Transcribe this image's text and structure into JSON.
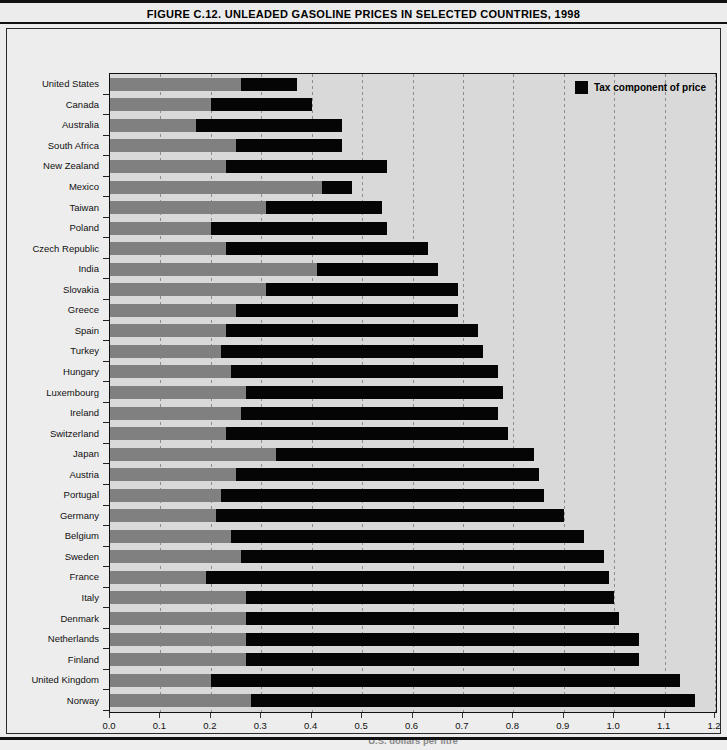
{
  "figure": {
    "title": "FIGURE C.12. UNLEADED GASOLINE PRICES IN SELECTED COUNTRIES, 1998"
  },
  "legend": {
    "label": "Tax component of price",
    "swatch_color": "#050505"
  },
  "colors": {
    "base_price": "#808080",
    "tax": "#050505",
    "plot_background": "#d9d9d9",
    "page_background": "#ececec",
    "axis_title": "#8a8a8a"
  },
  "chart_data": {
    "type": "bar",
    "orientation": "horizontal",
    "stacked": true,
    "title": "FIGURE C.12. UNLEADED GASOLINE PRICES IN SELECTED COUNTRIES, 1998",
    "xlabel": "U.S. dollars per litre",
    "ylabel": "",
    "xlim": [
      0.0,
      1.2
    ],
    "xticks": [
      "0.0",
      "0.1",
      "0.2",
      "0.3",
      "0.4",
      "0.5",
      "0.6",
      "0.7",
      "0.8",
      "0.9",
      "1.0",
      "1.1",
      "1.2"
    ],
    "xtick_values": [
      0.0,
      0.1,
      0.2,
      0.3,
      0.4,
      0.5,
      0.6,
      0.7,
      0.8,
      0.9,
      1.0,
      1.1,
      1.2
    ],
    "grid": true,
    "legend_position": "top-right",
    "categories": [
      "United States",
      "Canada",
      "Australia",
      "South Africa",
      "New Zealand",
      "Mexico",
      "Taiwan",
      "Poland",
      "Czech Republic",
      "India",
      "Slovakia",
      "Greece",
      "Spain",
      "Turkey",
      "Hungary",
      "Luxembourg",
      "Ireland",
      "Switzerland",
      "Japan",
      "Austria",
      "Portugal",
      "Germany",
      "Belgium",
      "Sweden",
      "France",
      "Italy",
      "Denmark",
      "Netherlands",
      "Finland",
      "United Kingdom",
      "Norway"
    ],
    "series": [
      {
        "name": "Pre-tax price",
        "color": "#808080",
        "values": [
          0.26,
          0.2,
          0.17,
          0.25,
          0.23,
          0.42,
          0.31,
          0.2,
          0.23,
          0.41,
          0.31,
          0.25,
          0.23,
          0.22,
          0.24,
          0.27,
          0.26,
          0.23,
          0.33,
          0.25,
          0.22,
          0.21,
          0.24,
          0.26,
          0.19,
          0.27,
          0.27,
          0.27,
          0.27,
          0.2,
          0.28
        ]
      },
      {
        "name": "Tax component of price",
        "color": "#050505",
        "values": [
          0.11,
          0.2,
          0.29,
          0.21,
          0.32,
          0.06,
          0.23,
          0.35,
          0.4,
          0.24,
          0.38,
          0.44,
          0.5,
          0.52,
          0.53,
          0.51,
          0.51,
          0.56,
          0.51,
          0.6,
          0.64,
          0.69,
          0.7,
          0.72,
          0.8,
          0.73,
          0.74,
          0.78,
          0.78,
          0.93,
          0.88
        ]
      }
    ],
    "totals": [
      0.37,
      0.4,
      0.46,
      0.46,
      0.55,
      0.48,
      0.54,
      0.55,
      0.63,
      0.65,
      0.69,
      0.69,
      0.73,
      0.74,
      0.77,
      0.78,
      0.77,
      0.79,
      0.84,
      0.85,
      0.86,
      0.9,
      0.94,
      0.98,
      0.99,
      1.0,
      1.01,
      1.05,
      1.05,
      1.13,
      1.16
    ]
  }
}
